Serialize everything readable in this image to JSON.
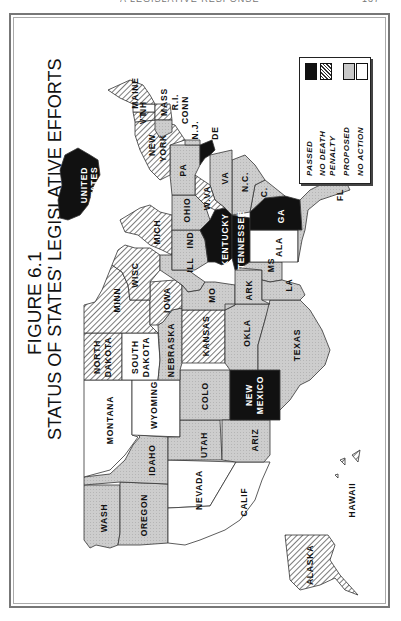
{
  "page": {
    "running_header": "A LEGISLATIVE RESPONSE",
    "page_number": "137"
  },
  "figure": {
    "number_label": "FIGURE 6.1",
    "title": "STATUS OF STATES' LEGISLATIVE EFFORTS"
  },
  "legend": {
    "items": [
      {
        "key": "passed",
        "label": "PASSED",
        "fill": "#111111"
      },
      {
        "key": "no_death_penalty",
        "label": "NO DEATH PENALTY",
        "label_line1": "NO DEATH",
        "label_line2": "PENALTY",
        "fill": "hatch"
      },
      {
        "key": "proposed",
        "label": "PROPOSED",
        "fill": "#c8c8c8"
      },
      {
        "key": "no_action",
        "label": "NO ACTION",
        "fill": "#ffffff"
      }
    ]
  },
  "colors": {
    "passed": "#111111",
    "proposed": "#c8c8c8",
    "no_action": "#ffffff",
    "hatch_line": "#333333",
    "border": "#333333"
  },
  "inset": {
    "united_states_label_line1": "UNITED",
    "united_states_label_line2": "STATES",
    "status": "passed"
  },
  "states": [
    {
      "name": "WASH",
      "label": "WASH",
      "status": "proposed"
    },
    {
      "name": "OREGON",
      "label": "OREGON",
      "status": "proposed"
    },
    {
      "name": "CALIF",
      "label": "CALIF",
      "status": "no_action"
    },
    {
      "name": "IDAHO",
      "label": "IDAHO",
      "status": "proposed"
    },
    {
      "name": "NEVADA",
      "label": "NEVADA",
      "status": "no_action"
    },
    {
      "name": "MONTANA",
      "label": "MONTANA",
      "status": "no_action"
    },
    {
      "name": "WYOMING",
      "label": "WYOMING",
      "status": "no_action"
    },
    {
      "name": "UTAH",
      "label": "UTAH",
      "status": "proposed"
    },
    {
      "name": "ARIZ",
      "label": "ARIZ",
      "status": "proposed"
    },
    {
      "name": "COLO",
      "label": "COLO",
      "status": "proposed"
    },
    {
      "name": "NEW MEXICO",
      "label_line1": "NEW",
      "label_line2": "MEXICO",
      "status": "passed"
    },
    {
      "name": "NORTH DAKOTA",
      "label_line1": "NORTH",
      "label_line2": "DAKOTA",
      "status": "no_death_penalty"
    },
    {
      "name": "SOUTH DAKOTA",
      "label_line1": "SOUTH",
      "label_line2": "DAKOTA",
      "status": "no_action"
    },
    {
      "name": "NEBRASKA",
      "label": "NEBRASKA",
      "status": "proposed"
    },
    {
      "name": "KANSAS",
      "label": "KANSAS",
      "status": "no_death_penalty"
    },
    {
      "name": "OKLA",
      "label": "OKLA",
      "status": "proposed"
    },
    {
      "name": "TEXAS",
      "label": "TEXAS",
      "status": "proposed"
    },
    {
      "name": "MINN",
      "label": "MINN",
      "status": "no_death_penalty"
    },
    {
      "name": "IOWA",
      "label": "IOWA",
      "status": "no_death_penalty"
    },
    {
      "name": "MO",
      "label": "MO",
      "status": "proposed"
    },
    {
      "name": "ARK",
      "label": "ARK",
      "status": "proposed"
    },
    {
      "name": "LA",
      "label": "LA",
      "status": "proposed"
    },
    {
      "name": "WISC",
      "label": "WISC",
      "status": "no_death_penalty"
    },
    {
      "name": "ILL",
      "label": "ILL",
      "status": "proposed"
    },
    {
      "name": "MICH",
      "label": "MICH",
      "status": "no_death_penalty"
    },
    {
      "name": "IND",
      "label": "IND",
      "status": "proposed"
    },
    {
      "name": "OHIO",
      "label": "OHIO",
      "status": "proposed"
    },
    {
      "name": "KENTUCKY",
      "label": "KENTUCKY",
      "status": "passed"
    },
    {
      "name": "TENNESSEE",
      "label": "TENNESSEE",
      "status": "passed"
    },
    {
      "name": "MS",
      "label": "MS",
      "status": "proposed"
    },
    {
      "name": "ALA",
      "label": "ALA",
      "status": "no_action"
    },
    {
      "name": "GA",
      "label": "GA",
      "status": "passed"
    },
    {
      "name": "FL",
      "label": "FL",
      "status": "proposed"
    },
    {
      "name": "S.C.",
      "label": "S.C.",
      "status": "proposed"
    },
    {
      "name": "N.C.",
      "label": "N.C.",
      "status": "proposed"
    },
    {
      "name": "VA",
      "label": "VA",
      "status": "proposed"
    },
    {
      "name": "W.VA",
      "label": "W.VA",
      "status": "no_death_penalty"
    },
    {
      "name": "PA",
      "label": "PA",
      "status": "proposed"
    },
    {
      "name": "NEW YORK",
      "label_line1": "NEW",
      "label_line2": "YORK",
      "status": "no_death_penalty"
    },
    {
      "name": "VT",
      "label": "VT",
      "status": "no_death_penalty"
    },
    {
      "name": "NH",
      "label": "NH",
      "status": "no_action"
    },
    {
      "name": "MAINE",
      "label": "MAINE",
      "status": "no_death_penalty"
    },
    {
      "name": "MASS",
      "label": "MASS",
      "status": "no_death_penalty"
    },
    {
      "name": "R.I.",
      "label": "R.I.",
      "status": "no_death_penalty"
    },
    {
      "name": "CONN",
      "label": "CONN",
      "status": "proposed"
    },
    {
      "name": "N.J.",
      "label": "N.J.",
      "status": "proposed"
    },
    {
      "name": "DE",
      "label": "DE",
      "status": "passed"
    },
    {
      "name": "MD",
      "label": "MD",
      "status": "passed"
    },
    {
      "name": "ALASKA",
      "label": "ALASKA",
      "status": "no_death_penalty"
    },
    {
      "name": "HAWAII",
      "label": "HAWAII",
      "status": "no_death_penalty"
    }
  ]
}
